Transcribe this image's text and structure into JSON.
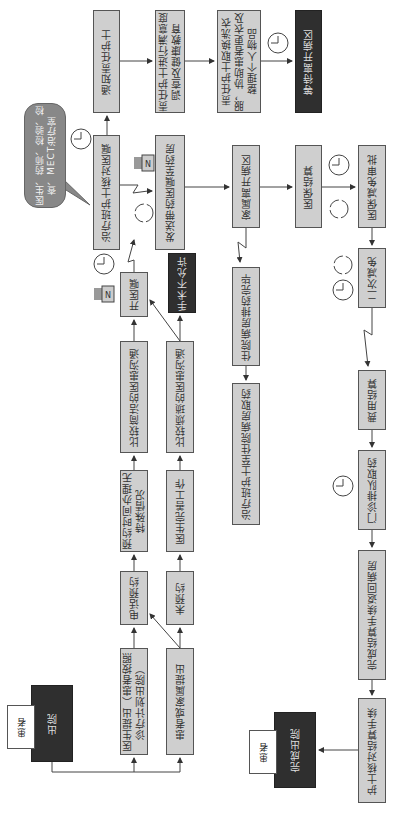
{
  "diagram": {
    "callout": {
      "text": "医生、药师、检验、检查、MECT治疗室"
    },
    "boxes": {
      "notify_nurse": "通知责任护士",
      "survey": "责任护士进行满意度调查及健康教育",
      "change_clothes": "责任护士取换洗衣服，协助患者更衣及整理个人物品",
      "wait_leave": "等待离开病区",
      "check_order": "治疗班护士核对医嘱",
      "send_order": "发送带药医嘱至药房",
      "family_leave": "家属离开病区",
      "insurance_settle": "医保结算",
      "insurance_review": "医保减免审批",
      "second_reduction": "二次减免",
      "fee_settle": "费用结算",
      "outpatient_pickup": "门诊排队取药",
      "complete_return": "完成结算手续返回病房",
      "nurse_verify": "护士核对结算手续",
      "complete_discharge": "完成出院",
      "ward_dispense": "住院病房排药完毕",
      "nurse_fetch": "治疗班护士至住院病房取药",
      "open_order": "开医嘱",
      "surgery_not_allowed": "手术不允许",
      "simple_comm": "比较简洁的医患沟通",
      "complex_comm": "比较烦琐的医患沟通",
      "scheduled_normal": "预约时间办理无特殊情况",
      "doctor_complete": "医生完善工作",
      "phone_booking": "电话预约",
      "no_booking": "未预约",
      "doctor_propose": "医生提出（患者按照诊疗计划出院）",
      "patient_propose": "患者或家属提出",
      "discharge": "出院"
    },
    "banners": {
      "patient_start": "患者",
      "patient_end": "患者"
    },
    "icons": [
      "clock-icon",
      "cycle-icon",
      "printer-icon"
    ]
  }
}
